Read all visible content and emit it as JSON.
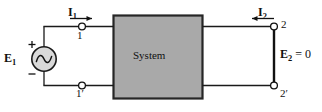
{
  "diagram": {
    "background_color": "#ffffff",
    "wire_color": "#1a1a1a",
    "box_fill_color": "#a9a9a9",
    "box_border_color": "#262626",
    "system_box": {
      "label": "System"
    },
    "source": {
      "label": "E",
      "subscript": "1",
      "plus_sign": "+",
      "minus_sign": "−",
      "type": "ac-voltage-source"
    },
    "currents": [
      {
        "label": "I",
        "subscript": "1",
        "direction": "right",
        "port": "input"
      },
      {
        "label": "I",
        "subscript": "2",
        "direction": "left",
        "port": "output"
      }
    ],
    "output_voltage": {
      "label": "E",
      "subscript": "2",
      "equals": "=",
      "value": "0"
    },
    "terminals": [
      {
        "name": "terminal-1",
        "label": "1",
        "side": "input",
        "position": "top"
      },
      {
        "name": "terminal-1p",
        "label": "1′",
        "side": "input",
        "position": "bottom"
      },
      {
        "name": "terminal-2",
        "label": "2",
        "side": "output",
        "position": "top"
      },
      {
        "name": "terminal-2p",
        "label": "2′",
        "side": "output",
        "position": "bottom"
      }
    ]
  }
}
